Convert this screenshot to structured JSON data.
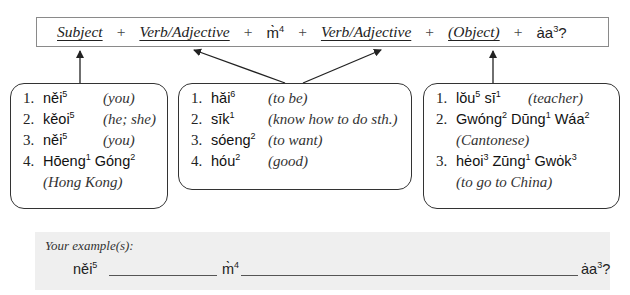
{
  "formula": {
    "subject": "Subject",
    "plus": "+",
    "verb_adj_1": "Verb/Adjective",
    "neg_base": "m̀",
    "neg_tone": "4",
    "verb_adj_2": "Verb/Adjective",
    "object": "(Object)",
    "particle_base": "ȧa",
    "particle_tone": "3",
    "question_mark": "?"
  },
  "subjects": [
    {
      "num": "1.",
      "base": "něi",
      "tone": "5",
      "gloss": "(you)"
    },
    {
      "num": "2.",
      "base": "kěoi",
      "tone": "5",
      "gloss": "(he; she)"
    },
    {
      "num": "3.",
      "base": "něi",
      "tone": "5",
      "gloss": "(you)"
    },
    {
      "num": "4.",
      "w1": "Hōeng",
      "t1": "1",
      "w2": "Góng",
      "t2": "2",
      "gloss": "(Hong Kong)"
    }
  ],
  "verbs": [
    {
      "num": "1.",
      "base": "hăi",
      "tone": "6",
      "gloss": "(to be)"
    },
    {
      "num": "2.",
      "base": "sīk",
      "tone": "1",
      "gloss": "(know how to do sth.)"
    },
    {
      "num": "3.",
      "base": "sóeng",
      "tone": "2",
      "gloss": "(to want)"
    },
    {
      "num": "4.",
      "base": "hóu",
      "tone": "2",
      "gloss": "(good)"
    }
  ],
  "objects": [
    {
      "num": "1.",
      "w1": "lŏu",
      "t1": "5",
      "w2": "sī",
      "t2": "1",
      "gloss": "(teacher)"
    },
    {
      "num": "2.",
      "w1": "Gwóng",
      "t1": "2",
      "w2": "Dūng",
      "t2": "1",
      "w3": "Wáa",
      "t3": "2",
      "gloss": "(Cantonese)"
    },
    {
      "num": "3.",
      "w1": "hėoi",
      "t1": "3",
      "w2": "Zūng",
      "t2": "1",
      "w3": "Gwȯk",
      "t3": "3",
      "gloss": "(to go to China)"
    }
  ],
  "practice": {
    "label": "Your example(s):",
    "subject_base": "něi",
    "subject_tone": "5",
    "neg_base": "m̀",
    "neg_tone": "4",
    "particle_base": "ȧa",
    "particle_tone": "3",
    "question_mark": "?"
  }
}
